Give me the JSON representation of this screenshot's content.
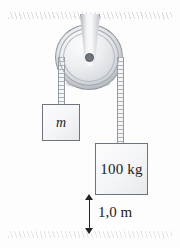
{
  "figure": {
    "background_color": "#fdfdfd",
    "line_color": "#232427"
  },
  "ceiling": {
    "name": "hatched-ceiling",
    "hatch_color": "#7882 96"
  },
  "ground": {
    "name": "hatched-ground",
    "hatch_color": "#788296"
  },
  "pulley": {
    "label": "",
    "body_color": "#d6d9de",
    "hub_color": "#6f757e"
  },
  "bracket": {
    "label": "",
    "color": "#c9ccd2"
  },
  "ropes": {
    "left_label": "",
    "right_label": "",
    "color": "#aeb3ba"
  },
  "blocks": [
    {
      "label": "m",
      "name": "mass-m-block"
    },
    {
      "label": "100 kg",
      "name": "mass-100kg-block"
    }
  ],
  "dimension": {
    "label": "1,0 m",
    "value": 1.0,
    "unit": "m",
    "decimal_separator": ","
  }
}
